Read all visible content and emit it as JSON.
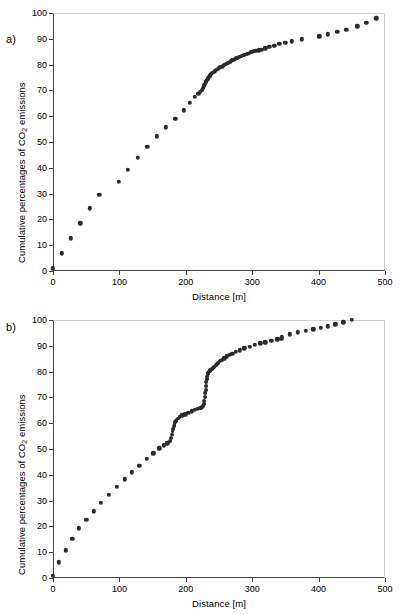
{
  "figure": {
    "panels": [
      {
        "label": "a)",
        "xlabel": "Distance [m]",
        "ylabel_main": "Cumulative percentages of CO",
        "ylabel_sub": "2",
        "ylabel_tail": " emissions"
      },
      {
        "label": "b)",
        "xlabel": "Distance [m]",
        "ylabel_main": "Cumulative percentages of CO",
        "ylabel_sub": "2",
        "ylabel_tail": " emissions"
      }
    ],
    "marker_color": "#2b2b2b",
    "axis_color": "#444444"
  },
  "chart_data": [
    {
      "type": "scatter",
      "panel": "a)",
      "title": "",
      "xlabel": "Distance [m]",
      "ylabel": "Cumulative percentages of CO2 emissions",
      "xlim": [
        0,
        500
      ],
      "ylim": [
        0,
        100
      ],
      "xticks": [
        0,
        100,
        200,
        300,
        400,
        500
      ],
      "yticks": [
        0,
        10,
        20,
        30,
        40,
        50,
        60,
        70,
        80,
        90,
        100
      ],
      "grid": false,
      "legend": "none",
      "marker": "filled-circle",
      "x": [
        0,
        13,
        27,
        41,
        55,
        70,
        99,
        113,
        128,
        142,
        156,
        170,
        184,
        197,
        206,
        214,
        219,
        222,
        224,
        226,
        227,
        228,
        229,
        230,
        231,
        232,
        233,
        234,
        235,
        236,
        237,
        238,
        240,
        242,
        244,
        246,
        248,
        250,
        252,
        254,
        256,
        258,
        260,
        262,
        264,
        266,
        268,
        270,
        272,
        274,
        276,
        278,
        280,
        282,
        284,
        286,
        288,
        290,
        292,
        294,
        296,
        298,
        300,
        303,
        306,
        310,
        314,
        320,
        326,
        333,
        341,
        350,
        360,
        375,
        401,
        414,
        428,
        442,
        458,
        472,
        487
      ],
      "y": [
        1.0,
        6.8,
        12.6,
        18.5,
        24.3,
        29.6,
        34.5,
        39.2,
        43.8,
        48.1,
        52.2,
        55.7,
        59.0,
        62.3,
        65.2,
        67.6,
        68.6,
        69.5,
        70.3,
        71.0,
        71.6,
        72.1,
        72.6,
        73.1,
        73.6,
        74.0,
        74.4,
        74.8,
        75.2,
        75.6,
        76.0,
        76.3,
        76.8,
        77.2,
        77.6,
        78.0,
        78.3,
        78.6,
        78.9,
        79.2,
        79.5,
        79.8,
        80.1,
        80.4,
        80.7,
        81.0,
        81.3,
        81.6,
        81.9,
        82.2,
        82.5,
        82.7,
        82.9,
        83.1,
        83.3,
        83.5,
        83.7,
        83.9,
        84.1,
        84.3,
        84.5,
        84.7,
        84.9,
        85.1,
        85.3,
        85.5,
        85.8,
        86.3,
        86.9,
        87.4,
        88.0,
        88.5,
        89.1,
        89.8,
        91.0,
        91.8,
        92.6,
        93.6,
        94.8,
        96.2,
        98.0
      ]
    },
    {
      "type": "scatter",
      "panel": "b)",
      "title": "",
      "xlabel": "Distance [m]",
      "ylabel": "Cumulative percentages of CO2 emissions",
      "xlim": [
        0,
        500
      ],
      "ylim": [
        0,
        100
      ],
      "xticks": [
        0,
        100,
        200,
        300,
        400,
        500
      ],
      "yticks": [
        0,
        10,
        20,
        30,
        40,
        50,
        60,
        70,
        80,
        90,
        100
      ],
      "grid": false,
      "legend": "none",
      "marker": "filled-circle",
      "x": [
        0,
        9,
        19,
        29,
        39,
        50,
        61,
        72,
        84,
        96,
        108,
        119,
        130,
        141,
        151,
        160,
        167,
        172,
        176,
        178,
        179,
        180,
        181,
        182,
        183,
        184,
        185,
        186,
        188,
        191,
        195,
        199,
        204,
        209,
        214,
        218,
        221,
        223,
        225,
        226,
        227,
        228,
        229,
        229.5,
        230,
        230.5,
        231,
        231.5,
        232,
        233,
        234,
        235,
        236,
        237,
        239,
        241,
        243,
        245,
        247,
        249,
        252,
        255,
        258,
        262,
        266,
        270,
        275,
        281,
        288,
        296,
        304,
        312,
        320,
        329,
        338,
        344,
        345,
        357,
        369,
        381,
        392,
        403,
        414,
        425,
        437,
        450
      ],
      "y": [
        0.8,
        6.1,
        10.7,
        15.3,
        19.2,
        22.6,
        25.9,
        29.1,
        32.2,
        35.3,
        38.3,
        40.9,
        43.6,
        46.1,
        48.4,
        50.2,
        51.4,
        52.2,
        53.2,
        54.4,
        55.6,
        56.8,
        57.9,
        58.9,
        59.7,
        60.3,
        60.8,
        61.2,
        61.8,
        62.4,
        63.0,
        63.5,
        64.1,
        64.6,
        65.1,
        65.5,
        65.8,
        66.0,
        66.2,
        66.6,
        67.4,
        68.6,
        70.2,
        71.6,
        73.0,
        74.4,
        75.8,
        77.0,
        78.1,
        79.0,
        79.6,
        80.0,
        80.3,
        80.6,
        81.0,
        81.4,
        81.9,
        82.4,
        82.9,
        83.4,
        84.0,
        84.6,
        85.2,
        85.9,
        86.5,
        87.0,
        87.6,
        88.3,
        89.0,
        89.7,
        90.3,
        90.9,
        91.4,
        92.0,
        92.5,
        92.8,
        93.3,
        94.5,
        95.2,
        95.8,
        96.4,
        97.0,
        97.6,
        98.3,
        99.1,
        100.0
      ]
    }
  ]
}
